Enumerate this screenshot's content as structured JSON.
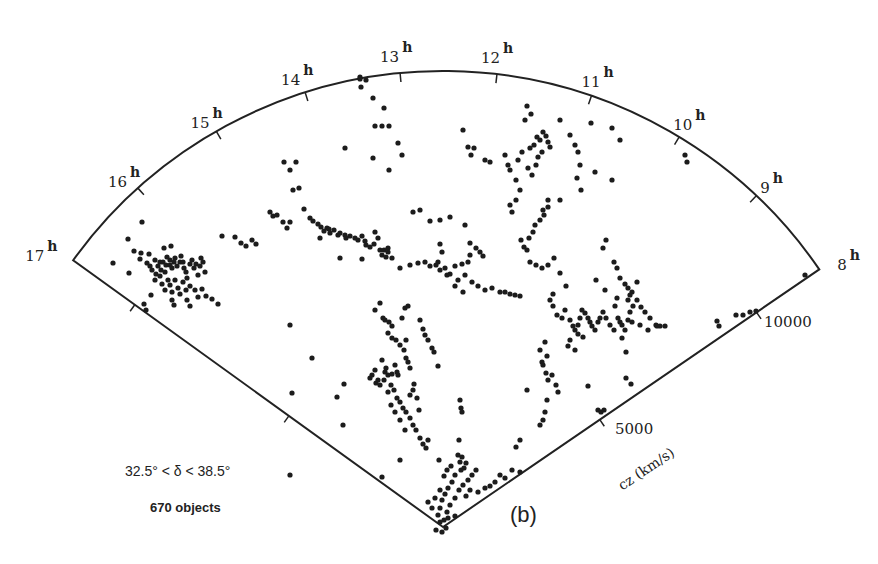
{
  "chart_data": {
    "type": "scatter",
    "projection": "polar-wedge",
    "title": "",
    "panel_label": "(b)",
    "xlabel": "Right Ascension (hours)",
    "ylabel": "cz (km/s)",
    "ra_range_hours": [
      8,
      17
    ],
    "cz_range": [
      0,
      12000
    ],
    "ra_ticks": [
      "17",
      "16",
      "15",
      "14",
      "13",
      "12",
      "11",
      "10",
      "9",
      "8"
    ],
    "ra_tick_suffix": "h",
    "cz_ticks": [
      5000,
      10000
    ],
    "cz_axis_label": "cz (km/s)",
    "declination_label": "32.5° < δ < 38.5°",
    "object_count_label": "670 objects",
    "n_objects": 670,
    "geometry_px": {
      "apex": [
        443,
        527
      ],
      "radius": 456,
      "left_angle_deg": 215.8,
      "right_angle_deg": 325.6
    },
    "points_px": [
      [
        113,
        263
      ],
      [
        128,
        239
      ],
      [
        142,
        222
      ],
      [
        129,
        273
      ],
      [
        134,
        251
      ],
      [
        141,
        253
      ],
      [
        140,
        259
      ],
      [
        147,
        263
      ],
      [
        150,
        266
      ],
      [
        152,
        270
      ],
      [
        155,
        260
      ],
      [
        158,
        266
      ],
      [
        160,
        262
      ],
      [
        161,
        270
      ],
      [
        163,
        262
      ],
      [
        166,
        265
      ],
      [
        165,
        272
      ],
      [
        167,
        257
      ],
      [
        170,
        260
      ],
      [
        170,
        265
      ],
      [
        172,
        268
      ],
      [
        174,
        262
      ],
      [
        175,
        258
      ],
      [
        177,
        266
      ],
      [
        180,
        262
      ],
      [
        181,
        256
      ],
      [
        183,
        262
      ],
      [
        184,
        268
      ],
      [
        186,
        272
      ],
      [
        187,
        278
      ],
      [
        190,
        264
      ],
      [
        192,
        260
      ],
      [
        194,
        268
      ],
      [
        196,
        264
      ],
      [
        198,
        275
      ],
      [
        200,
        266
      ],
      [
        201,
        258
      ],
      [
        203,
        262
      ],
      [
        205,
        272
      ],
      [
        155,
        280
      ],
      [
        160,
        276
      ],
      [
        162,
        284
      ],
      [
        165,
        290
      ],
      [
        168,
        280
      ],
      [
        170,
        285
      ],
      [
        172,
        292
      ],
      [
        175,
        280
      ],
      [
        178,
        288
      ],
      [
        180,
        294
      ],
      [
        183,
        282
      ],
      [
        186,
        290
      ],
      [
        190,
        286
      ],
      [
        195,
        290
      ],
      [
        198,
        297
      ],
      [
        202,
        289
      ],
      [
        206,
        296
      ],
      [
        212,
        299
      ],
      [
        218,
        304
      ],
      [
        149,
        254
      ],
      [
        164,
        248
      ],
      [
        171,
        246
      ],
      [
        144,
        304
      ],
      [
        146,
        310
      ],
      [
        190,
        306
      ],
      [
        156,
        274
      ],
      [
        151,
        295
      ],
      [
        172,
        300
      ],
      [
        174,
        305
      ],
      [
        187,
        300
      ],
      [
        222,
        236
      ],
      [
        235,
        237
      ],
      [
        241,
        243
      ],
      [
        246,
        246
      ],
      [
        252,
        240
      ],
      [
        256,
        244
      ],
      [
        270,
        212
      ],
      [
        273,
        216
      ],
      [
        277,
        215
      ],
      [
        283,
        222
      ],
      [
        287,
        228
      ],
      [
        290,
        222
      ],
      [
        290,
        170
      ],
      [
        296,
        162
      ],
      [
        293,
        190
      ],
      [
        299,
        188
      ],
      [
        284,
        162
      ],
      [
        304,
        209
      ],
      [
        310,
        218
      ],
      [
        313,
        221
      ],
      [
        318,
        224
      ],
      [
        321,
        227
      ],
      [
        324,
        231
      ],
      [
        327,
        228
      ],
      [
        330,
        233
      ],
      [
        334,
        230
      ],
      [
        338,
        235
      ],
      [
        340,
        233
      ],
      [
        345,
        235
      ],
      [
        350,
        236
      ],
      [
        355,
        238
      ],
      [
        358,
        240
      ],
      [
        362,
        236
      ],
      [
        365,
        241
      ],
      [
        370,
        247
      ],
      [
        374,
        244
      ],
      [
        378,
        238
      ],
      [
        380,
        250
      ],
      [
        382,
        255
      ],
      [
        384,
        250
      ],
      [
        386,
        257
      ],
      [
        388,
        252
      ],
      [
        375,
        232
      ],
      [
        320,
        238
      ],
      [
        329,
        229
      ],
      [
        346,
        238
      ],
      [
        340,
        258
      ],
      [
        362,
        259
      ],
      [
        366,
        245
      ],
      [
        388,
        248
      ],
      [
        392,
        258
      ],
      [
        345,
        148
      ],
      [
        360,
        77
      ],
      [
        366,
        80
      ],
      [
        361,
        87
      ],
      [
        373,
        98
      ],
      [
        384,
        108
      ],
      [
        375,
        126
      ],
      [
        382,
        126
      ],
      [
        389,
        126
      ],
      [
        373,
        158
      ],
      [
        398,
        143
      ],
      [
        402,
        155
      ],
      [
        389,
        170
      ],
      [
        360,
        79
      ],
      [
        413,
        212
      ],
      [
        420,
        210
      ],
      [
        430,
        221
      ],
      [
        440,
        220
      ],
      [
        450,
        217
      ],
      [
        465,
        225
      ],
      [
        410,
        265
      ],
      [
        400,
        268
      ],
      [
        418,
        263
      ],
      [
        425,
        262
      ],
      [
        430,
        266
      ],
      [
        436,
        265
      ],
      [
        440,
        270
      ],
      [
        445,
        268
      ],
      [
        450,
        274
      ],
      [
        455,
        266
      ],
      [
        458,
        280
      ],
      [
        462,
        264
      ],
      [
        465,
        275
      ],
      [
        468,
        262
      ],
      [
        470,
        255
      ],
      [
        472,
        282
      ],
      [
        478,
        286
      ],
      [
        485,
        290
      ],
      [
        492,
        288
      ],
      [
        500,
        292
      ],
      [
        505,
        292
      ],
      [
        510,
        294
      ],
      [
        515,
        295
      ],
      [
        520,
        296
      ],
      [
        470,
        243
      ],
      [
        476,
        248
      ],
      [
        480,
        252
      ],
      [
        483,
        256
      ],
      [
        440,
        244
      ],
      [
        442,
        252
      ],
      [
        438,
        262
      ],
      [
        447,
        275
      ],
      [
        455,
        286
      ],
      [
        463,
        292
      ],
      [
        463,
        130
      ],
      [
        468,
        147
      ],
      [
        471,
        155
      ],
      [
        485,
        160
      ],
      [
        490,
        162
      ],
      [
        474,
        148
      ],
      [
        505,
        155
      ],
      [
        508,
        165
      ],
      [
        510,
        170
      ],
      [
        516,
        180
      ],
      [
        520,
        190
      ],
      [
        516,
        200
      ],
      [
        510,
        205
      ],
      [
        512,
        212
      ],
      [
        518,
        160
      ],
      [
        522,
        152
      ],
      [
        530,
        148
      ],
      [
        534,
        145
      ],
      [
        537,
        137
      ],
      [
        540,
        140
      ],
      [
        543,
        132
      ],
      [
        546,
        136
      ],
      [
        548,
        142
      ],
      [
        550,
        147
      ],
      [
        542,
        152
      ],
      [
        538,
        157
      ],
      [
        536,
        165
      ],
      [
        532,
        175
      ],
      [
        528,
        168
      ],
      [
        525,
        120
      ],
      [
        527,
        106
      ],
      [
        531,
        114
      ],
      [
        544,
        215
      ],
      [
        548,
        207
      ],
      [
        548,
        200
      ],
      [
        543,
        210
      ],
      [
        540,
        220
      ],
      [
        535,
        225
      ],
      [
        533,
        232
      ],
      [
        529,
        238
      ],
      [
        524,
        247
      ],
      [
        521,
        240
      ],
      [
        527,
        250
      ],
      [
        530,
        262
      ],
      [
        536,
        265
      ],
      [
        542,
        268
      ],
      [
        548,
        265
      ],
      [
        554,
        258
      ],
      [
        560,
        120
      ],
      [
        570,
        135
      ],
      [
        575,
        145
      ],
      [
        578,
        152
      ],
      [
        580,
        165
      ],
      [
        577,
        178
      ],
      [
        560,
        200
      ],
      [
        581,
        190
      ],
      [
        591,
        123
      ],
      [
        612,
        128
      ],
      [
        620,
        140
      ],
      [
        595,
        172
      ],
      [
        612,
        180
      ],
      [
        685,
        155
      ],
      [
        687,
        162
      ],
      [
        550,
        300
      ],
      [
        553,
        306
      ],
      [
        557,
        315
      ],
      [
        562,
        318
      ],
      [
        565,
        310
      ],
      [
        570,
        320
      ],
      [
        573,
        326
      ],
      [
        575,
        330
      ],
      [
        578,
        325
      ],
      [
        580,
        318
      ],
      [
        582,
        310
      ],
      [
        585,
        313
      ],
      [
        588,
        318
      ],
      [
        590,
        322
      ],
      [
        592,
        326
      ],
      [
        595,
        330
      ],
      [
        598,
        322
      ],
      [
        600,
        318
      ],
      [
        603,
        312
      ],
      [
        606,
        318
      ],
      [
        610,
        325
      ],
      [
        614,
        330
      ],
      [
        618,
        318
      ],
      [
        620,
        322
      ],
      [
        625,
        330
      ],
      [
        628,
        320
      ],
      [
        630,
        312
      ],
      [
        633,
        306
      ],
      [
        637,
        300
      ],
      [
        641,
        307
      ],
      [
        645,
        312
      ],
      [
        650,
        318
      ],
      [
        656,
        325
      ],
      [
        660,
        326
      ],
      [
        665,
        326
      ],
      [
        657,
        326
      ],
      [
        648,
        330
      ],
      [
        632,
        322
      ],
      [
        622,
        325
      ],
      [
        640,
        325
      ],
      [
        583,
        337
      ],
      [
        570,
        340
      ],
      [
        568,
        346
      ],
      [
        575,
        350
      ],
      [
        603,
        248
      ],
      [
        606,
        240
      ],
      [
        614,
        262
      ],
      [
        617,
        268
      ],
      [
        620,
        278
      ],
      [
        625,
        284
      ],
      [
        628,
        288
      ],
      [
        632,
        292
      ],
      [
        637,
        282
      ],
      [
        628,
        300
      ],
      [
        630,
        295
      ],
      [
        596,
        280
      ],
      [
        605,
        290
      ],
      [
        617,
        298
      ],
      [
        615,
        306
      ],
      [
        622,
        338
      ],
      [
        626,
        352
      ],
      [
        626,
        378
      ],
      [
        631,
        384
      ],
      [
        588,
        386
      ],
      [
        578,
        334
      ],
      [
        566,
        286
      ],
      [
        560,
        273
      ],
      [
        553,
        294
      ],
      [
        717,
        321
      ],
      [
        719,
        326
      ],
      [
        736,
        315
      ],
      [
        743,
        315
      ],
      [
        750,
        312
      ],
      [
        756,
        311
      ],
      [
        805,
        275
      ],
      [
        375,
        310
      ],
      [
        380,
        303
      ],
      [
        383,
        318
      ],
      [
        385,
        320
      ],
      [
        389,
        322
      ],
      [
        392,
        326
      ],
      [
        388,
        333
      ],
      [
        392,
        338
      ],
      [
        396,
        340
      ],
      [
        400,
        345
      ],
      [
        404,
        350
      ],
      [
        406,
        358
      ],
      [
        408,
        362
      ],
      [
        410,
        368
      ],
      [
        382,
        360
      ],
      [
        386,
        368
      ],
      [
        384,
        380
      ],
      [
        380,
        385
      ],
      [
        376,
        383
      ],
      [
        388,
        375
      ],
      [
        391,
        385
      ],
      [
        394,
        390
      ],
      [
        397,
        398
      ],
      [
        400,
        402
      ],
      [
        403,
        408
      ],
      [
        406,
        412
      ],
      [
        410,
        418
      ],
      [
        413,
        425
      ],
      [
        416,
        430
      ],
      [
        420,
        438
      ],
      [
        423,
        444
      ],
      [
        426,
        448
      ],
      [
        428,
        440
      ],
      [
        410,
        395
      ],
      [
        413,
        390
      ],
      [
        402,
        318
      ],
      [
        405,
        308
      ],
      [
        408,
        306
      ],
      [
        420,
        320
      ],
      [
        423,
        329
      ],
      [
        425,
        335
      ],
      [
        428,
        340
      ],
      [
        432,
        348
      ],
      [
        434,
        352
      ],
      [
        438,
        366
      ],
      [
        406,
        340
      ],
      [
        398,
        375
      ],
      [
        395,
        365
      ],
      [
        392,
        374
      ],
      [
        388,
        392
      ],
      [
        391,
        405
      ],
      [
        395,
        412
      ],
      [
        400,
        420
      ],
      [
        405,
        430
      ],
      [
        397,
        372
      ],
      [
        414,
        384
      ],
      [
        417,
        398
      ],
      [
        419,
        410
      ],
      [
        344,
        384
      ],
      [
        337,
        397
      ],
      [
        343,
        425
      ],
      [
        290,
        325
      ],
      [
        312,
        358
      ],
      [
        292,
        393
      ],
      [
        290,
        475
      ],
      [
        382,
        477
      ],
      [
        400,
        460
      ],
      [
        378,
        380
      ],
      [
        385,
        372
      ],
      [
        370,
        378
      ],
      [
        375,
        370
      ],
      [
        372,
        375
      ],
      [
        460,
        400
      ],
      [
        461,
        408
      ],
      [
        462,
        412
      ],
      [
        461,
        470
      ],
      [
        459,
        440
      ],
      [
        458,
        455
      ],
      [
        462,
        457
      ],
      [
        460,
        462
      ],
      [
        466,
        463
      ],
      [
        464,
        468
      ],
      [
        455,
        475
      ],
      [
        452,
        482
      ],
      [
        448,
        488
      ],
      [
        445,
        494
      ],
      [
        442,
        500
      ],
      [
        440,
        508
      ],
      [
        438,
        515
      ],
      [
        440,
        522
      ],
      [
        444,
        520
      ],
      [
        447,
        512
      ],
      [
        450,
        505
      ],
      [
        455,
        498
      ],
      [
        459,
        490
      ],
      [
        463,
        485
      ],
      [
        468,
        480
      ],
      [
        472,
        475
      ],
      [
        476,
        470
      ],
      [
        470,
        490
      ],
      [
        466,
        496
      ],
      [
        478,
        492
      ],
      [
        485,
        488
      ],
      [
        490,
        486
      ],
      [
        495,
        482
      ],
      [
        500,
        475
      ],
      [
        505,
        478
      ],
      [
        512,
        470
      ],
      [
        520,
        472
      ],
      [
        448,
        518
      ],
      [
        455,
        516
      ],
      [
        432,
        508
      ],
      [
        428,
        502
      ],
      [
        435,
        498
      ],
      [
        440,
        490
      ],
      [
        444,
        476
      ],
      [
        447,
        470
      ],
      [
        451,
        466
      ],
      [
        439,
        460
      ],
      [
        516,
        447
      ],
      [
        520,
        440
      ],
      [
        540,
        425
      ],
      [
        543,
        420
      ],
      [
        545,
        412
      ],
      [
        547,
        400
      ],
      [
        548,
        380
      ],
      [
        552,
        375
      ],
      [
        556,
        385
      ],
      [
        558,
        392
      ],
      [
        527,
        390
      ],
      [
        540,
        350
      ],
      [
        542,
        362
      ],
      [
        543,
        365
      ],
      [
        546,
        373
      ],
      [
        547,
        356
      ],
      [
        545,
        342
      ],
      [
        598,
        410
      ],
      [
        601,
        412
      ],
      [
        604,
        410
      ],
      [
        436,
        530
      ],
      [
        442,
        532
      ],
      [
        446,
        528
      ]
    ]
  }
}
